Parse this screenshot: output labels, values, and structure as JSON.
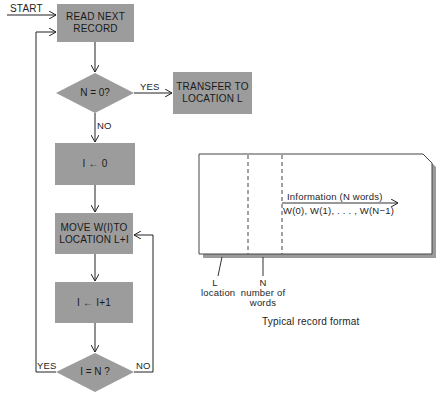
{
  "flowchart": {
    "start_label": "START",
    "nodes": [
      {
        "id": "read",
        "type": "process",
        "text": "READ NEXT\nRECORD"
      },
      {
        "id": "check_n",
        "type": "decision",
        "text": "N = 0?"
      },
      {
        "id": "transfer",
        "type": "process",
        "text": "TRANSFER TO\nLOCATION L"
      },
      {
        "id": "init_i",
        "type": "process",
        "text": "I ← 0"
      },
      {
        "id": "move",
        "type": "process",
        "text": "MOVE W(I)TO\nLOCATION L+I"
      },
      {
        "id": "inc_i",
        "type": "process",
        "text": "I ← I+1"
      },
      {
        "id": "check_i",
        "type": "decision",
        "text": "I = N ?"
      }
    ],
    "edge_labels": {
      "check_n_yes": "YES",
      "check_n_no": "NO",
      "check_i_yes": "YES",
      "check_i_no": "NO"
    },
    "colors": {
      "box_fill": "#9c9c9c",
      "line": "#222222"
    }
  },
  "record_format": {
    "caption": "Typical record format",
    "info_label": "Information  (N words)",
    "words_label": "W(0), W(1), . . . , W(N−1)",
    "field_l": {
      "letter": "L",
      "desc": "location"
    },
    "field_n": {
      "letter": "N",
      "desc_line1": "number of",
      "desc_line2": "words"
    }
  }
}
